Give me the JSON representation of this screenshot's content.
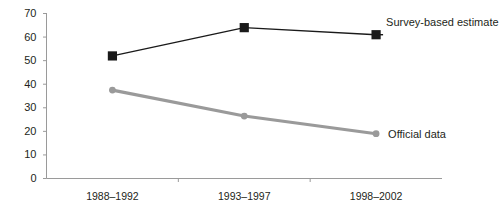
{
  "chart_data": {
    "type": "line",
    "title": "",
    "subtitle": "",
    "xlabel": "",
    "ylabel": "",
    "categories": [
      "1988–1992",
      "1993–1997",
      "1998–2002"
    ],
    "series": [
      {
        "name": "Survey-based estimate",
        "values": [
          52,
          64,
          61
        ],
        "color": "#1a1a1a",
        "marker": "square",
        "label_position": "top-right"
      },
      {
        "name": "Official data",
        "values": [
          37.5,
          26.5,
          19
        ],
        "color": "#9a9a9a",
        "marker": "circle",
        "label_position": "bottom-right"
      }
    ],
    "ylim": [
      0,
      70
    ],
    "yticks": [
      0,
      10,
      20,
      30,
      40,
      50,
      60,
      70
    ],
    "ytick_labels": [
      "0",
      "10",
      "20",
      "30",
      "40",
      "50",
      "60",
      "70"
    ],
    "grid": false,
    "legend_position": "inline-right",
    "axis_color": "#9a9a9a",
    "background_color": "#ffffff"
  },
  "axes": {
    "y_axis_name": "y-axis",
    "x_axis_name": "x-axis"
  }
}
